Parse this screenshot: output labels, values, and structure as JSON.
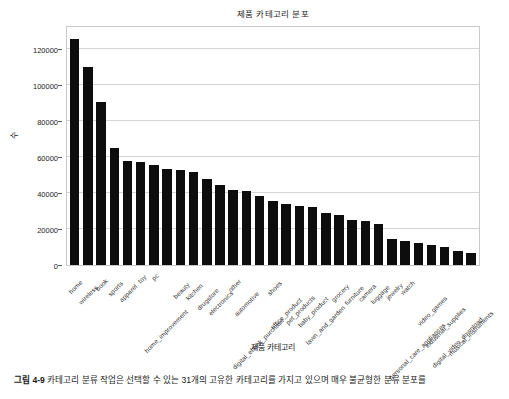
{
  "figure": {
    "caption_number": "그림 4-9",
    "caption_text": "카테고리 분류 작업은 선택할 수 있는 31개의 고유한 카테고리를 가지고 있으며 매우 불균형한 분류 분포를"
  },
  "chart_data": {
    "type": "bar",
    "title": "제품 카테고리 분포",
    "xlabel": "제품 카테고리",
    "ylabel": "수",
    "grid": true,
    "legend": "none",
    "ylim": [
      0,
      132000
    ],
    "yticks": [
      0,
      20000,
      40000,
      60000,
      80000,
      100000,
      120000
    ],
    "ytick_labels": [
      "0",
      "20000",
      "40000",
      "60000",
      "80000",
      "100000",
      "120000"
    ],
    "bar_color": "#0d0d0d",
    "categories": [
      "home",
      "wireless",
      "book",
      "sports",
      "apparel",
      "toy",
      "pc",
      "home_improvement",
      "beauty",
      "kitchen",
      "drugstore",
      "electronics",
      "other",
      "automotive",
      "digital_ebook_purchase",
      "shoes",
      "office_product",
      "pet_products",
      "baby_product",
      "lawn_and_garden",
      "grocery",
      "furniture",
      "camera",
      "luggage",
      "jewelry",
      "watch",
      "personal_care_appliances",
      "video_games",
      "industrial_supplies",
      "digital_video_download",
      "musical_instruments"
    ],
    "values": [
      125500,
      110000,
      90500,
      65000,
      57500,
      57000,
      55500,
      53500,
      52500,
      51500,
      47500,
      44500,
      41500,
      41000,
      38500,
      35500,
      34000,
      32500,
      32000,
      29000,
      28000,
      25000,
      24500,
      22500,
      14500,
      13500,
      12000,
      11000,
      10000,
      7500,
      6500
    ]
  }
}
